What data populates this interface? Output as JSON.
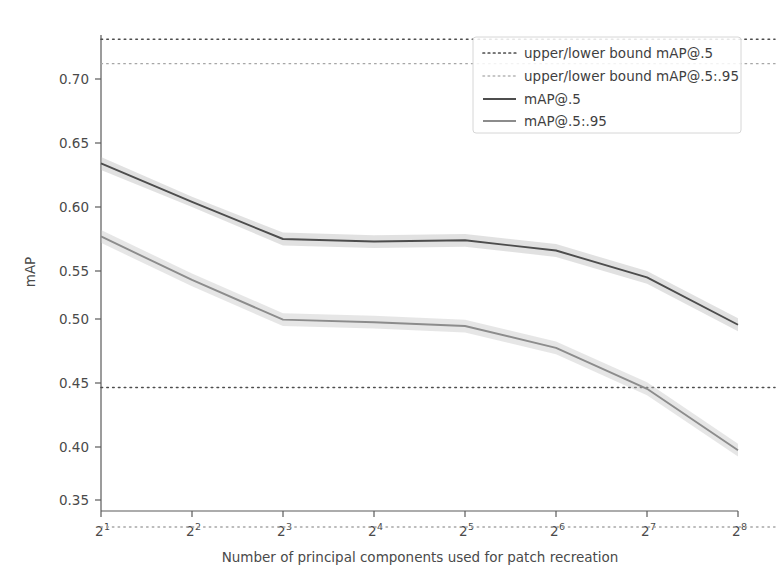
{
  "chart_data": {
    "type": "line",
    "title": "",
    "xlabel": "Number of principal components used for patch recreation",
    "ylabel": "mAP",
    "xscale": "log2",
    "xtick_labels": [
      "2",
      "2",
      "2",
      "2",
      "2",
      "2",
      "2",
      "2"
    ],
    "xtick_exponents": [
      "1",
      "2",
      "3",
      "4",
      "5",
      "6",
      "7",
      "8"
    ],
    "x": [
      2,
      4,
      8,
      16,
      32,
      64,
      128,
      256
    ],
    "xlim": [
      2,
      256
    ],
    "ytick_labels": [
      "0.35",
      "0.40",
      "0.45",
      "0.50",
      "0.55",
      "0.60",
      "0.65",
      "0.70"
    ],
    "yticks": [
      0.35,
      0.4,
      0.45,
      0.5,
      0.55,
      0.6,
      0.65,
      0.7
    ],
    "ylim": [
      0.327,
      0.742
    ],
    "grid": false,
    "legend_position": "upper right",
    "series": [
      {
        "name": "mAP@.5",
        "style": "solid",
        "color": "#4d4d4d",
        "values": [
          0.634,
          0.604,
          0.575,
          0.573,
          0.574,
          0.566,
          0.545,
          0.508
        ],
        "band_upper": [
          0.639,
          0.608,
          0.58,
          0.578,
          0.579,
          0.571,
          0.55,
          0.513
        ],
        "band_lower": [
          0.629,
          0.6,
          0.57,
          0.568,
          0.569,
          0.561,
          0.54,
          0.503
        ]
      },
      {
        "name": "mAP@.5:.95",
        "style": "solid",
        "color": "#8c8c8c",
        "values": [
          0.577,
          0.543,
          0.512,
          0.51,
          0.507,
          0.49,
          0.458,
          0.41
        ],
        "band_upper": [
          0.582,
          0.548,
          0.517,
          0.515,
          0.512,
          0.495,
          0.463,
          0.415
        ],
        "band_lower": [
          0.572,
          0.538,
          0.507,
          0.505,
          0.502,
          0.485,
          0.453,
          0.405
        ]
      }
    ],
    "reference_lines": [
      {
        "name": "upper bound mAP@.5",
        "legend": "upper/lower bound mAP@.5",
        "style": "dotted",
        "color": "#4d4d4d",
        "y": 0.731
      },
      {
        "name": "lower bound mAP@.5",
        "legend": "upper/lower bound mAP@.5",
        "style": "dotted",
        "color": "#4d4d4d",
        "y": 0.459
      },
      {
        "name": "upper bound mAP@.5:.95",
        "legend": "upper/lower bound mAP@.5:.95",
        "style": "dotted",
        "color": "#a6a6a6",
        "y": 0.712
      },
      {
        "name": "lower bound mAP@.5:.95",
        "legend": "upper/lower bound mAP@.5:.95",
        "style": "dotted",
        "color": "#a6a6a6",
        "y": 0.35
      }
    ],
    "legend_entries": [
      {
        "label": "upper/lower bound mAP@.5",
        "style": "dotted",
        "color": "#4d4d4d"
      },
      {
        "label": "upper/lower bound mAP@.5:.95",
        "style": "dotted",
        "color": "#a6a6a6"
      },
      {
        "label": "mAP@.5",
        "style": "solid",
        "color": "#4d4d4d"
      },
      {
        "label": "mAP@.5:.95",
        "style": "solid",
        "color": "#8c8c8c"
      }
    ]
  },
  "axes": {
    "ylabel": "mAP",
    "xlabel": "Number of principal components used for patch recreation",
    "ytick_0": "0.70",
    "ytick_1": "0.65",
    "ytick_2": "0.60",
    "ytick_3": "0.55",
    "ytick_4": "0.50",
    "ytick_5": "0.45",
    "ytick_6": "0.40",
    "ytick_7": "0.35",
    "xtick_base": "2",
    "xexp_0": "1",
    "xexp_1": "2",
    "xexp_2": "3",
    "xexp_3": "4",
    "xexp_4": "5",
    "xexp_5": "6",
    "xexp_6": "7",
    "xexp_7": "8"
  },
  "legend": {
    "entry_0": "upper/lower bound mAP@.5",
    "entry_1": "upper/lower bound mAP@.5:.95",
    "entry_2": "mAP@.5",
    "entry_3": "mAP@.5:.95"
  }
}
